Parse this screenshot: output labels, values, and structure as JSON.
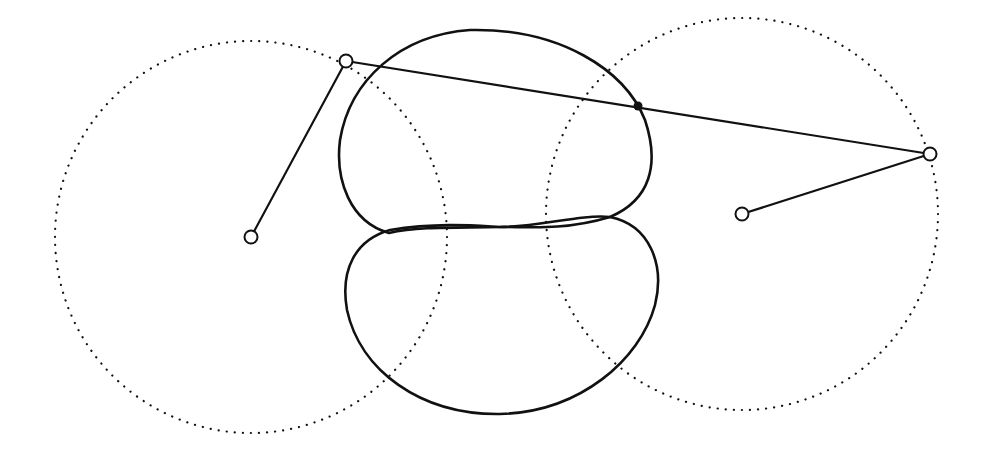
{
  "diagram": {
    "type": "four-bar linkage with coupler curve",
    "colors": {
      "ink": "#111111",
      "background": "#ffffff"
    },
    "left_crank_circle": {
      "cx": 251,
      "cy": 237,
      "r": 196
    },
    "right_crank_circle": {
      "cx": 742,
      "cy": 214,
      "r": 196
    },
    "pivots": {
      "left_fixed": {
        "x": 251,
        "y": 237
      },
      "right_fixed": {
        "x": 742,
        "y": 214
      },
      "left_moving": {
        "x": 346,
        "y": 61
      },
      "right_moving": {
        "x": 930,
        "y": 154
      }
    },
    "tracer_point": {
      "x": 638,
      "y": 106
    },
    "coupler_curve": {
      "upper_lobe": "M389,233 C350,222 335,180 340,140 C350,80 400,35 470,30 C560,28 625,70 645,120 C660,165 650,200 610,217 C560,232 520,226 500,227 C460,228 420,226 389,233 Z",
      "lower_lobe": "M390,230 C440,222 480,226 500,227 C540,227 580,214 610,217 C650,225 665,265 655,305 C640,360 580,412 500,414 C420,415 360,370 347,310 C340,270 355,240 390,230 Z"
    }
  }
}
